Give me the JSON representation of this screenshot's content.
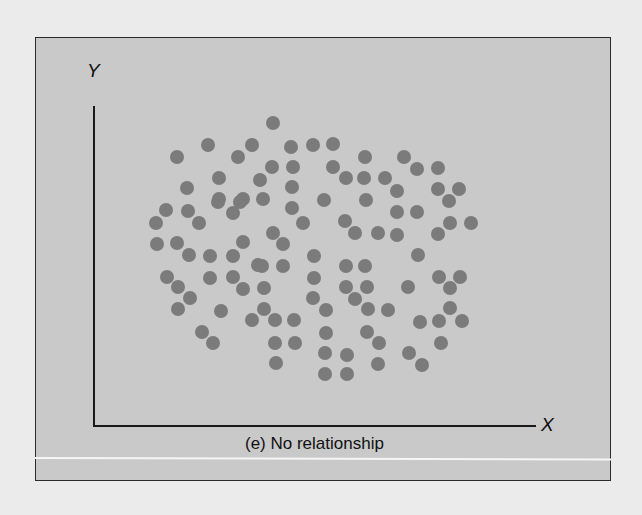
{
  "figure": {
    "y_axis_label": "Y",
    "x_axis_label": "X",
    "caption": "(e) No relationship"
  },
  "colors": {
    "panel_background": "#c9c9c9",
    "dot": "#7b7b7b",
    "axis": "#1a1a1a",
    "page_background": "#ebebeb"
  },
  "chart_data": {
    "type": "scatter",
    "title": "(e) No relationship",
    "xlabel": "X",
    "ylabel": "Y",
    "grid": false,
    "legend": null,
    "note": "Point coordinates given in screen pixel space (x right, y down); plot origin at (94,426). No tick values shown.",
    "points": [
      [
        273,
        123
      ],
      [
        208,
        145
      ],
      [
        252,
        145
      ],
      [
        291,
        147
      ],
      [
        313,
        145
      ],
      [
        333,
        144
      ],
      [
        177,
        157
      ],
      [
        238,
        157
      ],
      [
        365,
        157
      ],
      [
        404,
        157
      ],
      [
        272,
        167
      ],
      [
        293,
        167
      ],
      [
        333,
        167
      ],
      [
        417,
        169
      ],
      [
        438,
        168
      ],
      [
        219,
        178
      ],
      [
        260,
        180
      ],
      [
        346,
        178
      ],
      [
        364,
        178
      ],
      [
        385,
        178
      ],
      [
        187,
        188
      ],
      [
        292,
        187
      ],
      [
        397,
        191
      ],
      [
        438,
        189
      ],
      [
        459,
        189
      ],
      [
        219,
        199
      ],
      [
        243,
        199
      ],
      [
        263,
        199
      ],
      [
        324,
        200
      ],
      [
        366,
        200
      ],
      [
        449,
        201
      ],
      [
        166,
        210
      ],
      [
        188,
        211
      ],
      [
        218,
        202
      ],
      [
        240,
        202
      ],
      [
        292,
        208
      ],
      [
        397,
        212
      ],
      [
        417,
        212
      ],
      [
        156,
        223
      ],
      [
        199,
        223
      ],
      [
        233,
        213
      ],
      [
        303,
        223
      ],
      [
        345,
        221
      ],
      [
        450,
        223
      ],
      [
        471,
        223
      ],
      [
        273,
        233
      ],
      [
        355,
        233
      ],
      [
        378,
        233
      ],
      [
        397,
        235
      ],
      [
        438,
        234
      ],
      [
        157,
        244
      ],
      [
        177,
        243
      ],
      [
        243,
        242
      ],
      [
        283,
        244
      ],
      [
        189,
        255
      ],
      [
        210,
        256
      ],
      [
        233,
        256
      ],
      [
        314,
        256
      ],
      [
        418,
        255
      ],
      [
        258,
        265
      ],
      [
        262,
        266
      ],
      [
        283,
        266
      ],
      [
        346,
        266
      ],
      [
        365,
        266
      ],
      [
        167,
        277
      ],
      [
        210,
        278
      ],
      [
        233,
        277
      ],
      [
        314,
        278
      ],
      [
        439,
        277
      ],
      [
        460,
        277
      ],
      [
        178,
        287
      ],
      [
        243,
        289
      ],
      [
        264,
        288
      ],
      [
        346,
        287
      ],
      [
        367,
        287
      ],
      [
        408,
        287
      ],
      [
        450,
        288
      ],
      [
        190,
        298
      ],
      [
        313,
        298
      ],
      [
        355,
        299
      ],
      [
        178,
        309
      ],
      [
        221,
        311
      ],
      [
        264,
        309
      ],
      [
        326,
        310
      ],
      [
        368,
        309
      ],
      [
        388,
        310
      ],
      [
        450,
        308
      ],
      [
        252,
        320
      ],
      [
        275,
        320
      ],
      [
        294,
        320
      ],
      [
        420,
        322
      ],
      [
        439,
        321
      ],
      [
        462,
        321
      ],
      [
        202,
        332
      ],
      [
        326,
        333
      ],
      [
        367,
        332
      ],
      [
        213,
        343
      ],
      [
        275,
        343
      ],
      [
        295,
        343
      ],
      [
        379,
        343
      ],
      [
        441,
        343
      ],
      [
        325,
        353
      ],
      [
        347,
        355
      ],
      [
        409,
        353
      ],
      [
        276,
        363
      ],
      [
        378,
        364
      ],
      [
        422,
        365
      ],
      [
        325,
        374
      ],
      [
        347,
        374
      ]
    ]
  }
}
